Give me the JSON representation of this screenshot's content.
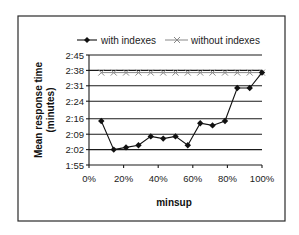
{
  "chart_data": {
    "type": "line",
    "title": "",
    "xlabel": "minsup",
    "ylabel": "Mean response time (minutes)",
    "ylabel_lines": [
      "Mean response time",
      "(minutes)"
    ],
    "x_ticks": [
      "0%",
      "20%",
      "40%",
      "60%",
      "80%",
      "100%"
    ],
    "y_ticks": [
      "1:55",
      "2:02",
      "2:09",
      "2:16",
      "2:24",
      "2:31",
      "2:38",
      "2:45"
    ],
    "y_tick_seconds": [
      115,
      122,
      129,
      136,
      144,
      151,
      158,
      165
    ],
    "xlim": [
      0,
      100
    ],
    "ylim_seconds": [
      115,
      165
    ],
    "grid": true,
    "legend_position": "top",
    "x": [
      7.1,
      14.3,
      21.4,
      28.6,
      35.7,
      42.9,
      50.0,
      57.1,
      64.3,
      71.4,
      78.6,
      85.7,
      92.9,
      100.0
    ],
    "series": [
      {
        "name": "with indexes",
        "marker": "diamond",
        "color": "#111111",
        "values": [
          "2:15",
          "2:02",
          "2:03",
          "2:04",
          "2:08",
          "2:07",
          "2:08",
          "2:04",
          "2:14",
          "2:13",
          "2:15",
          "2:30",
          "2:30",
          "2:37"
        ],
        "values_seconds": [
          135,
          122,
          123,
          124,
          128,
          127,
          128,
          124,
          134,
          133,
          135,
          150,
          150,
          157
        ]
      },
      {
        "name": "without indexes",
        "marker": "x",
        "color": "#888888",
        "values": [
          "2:37",
          "2:37",
          "2:37",
          "2:37",
          "2:37",
          "2:37",
          "2:37",
          "2:37",
          "2:37",
          "2:37",
          "2:37",
          "2:37",
          "2:37",
          "2:37"
        ],
        "values_seconds": [
          157,
          157,
          157,
          157,
          157,
          157,
          157,
          157,
          157,
          157,
          157,
          157,
          157,
          157
        ]
      }
    ]
  },
  "legend": {
    "items": [
      {
        "label": "with indexes"
      },
      {
        "label": "without indexes"
      }
    ]
  }
}
